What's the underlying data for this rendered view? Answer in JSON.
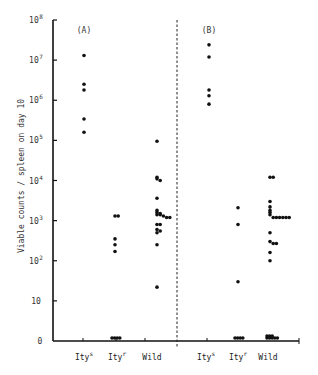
{
  "chart_data": {
    "type": "scatter",
    "title": "",
    "xlabel": "",
    "ylabel": "Viable counts / spleen on day 10",
    "yscale": "log",
    "ylim": [
      0,
      100000000
    ],
    "y_ticks": [
      {
        "value": 0,
        "base": "0",
        "exp": ""
      },
      {
        "value": 10,
        "base": "10",
        "exp": ""
      },
      {
        "value": 100,
        "base": "10",
        "exp": "2"
      },
      {
        "value": 1000,
        "base": "10",
        "exp": "3"
      },
      {
        "value": 10000,
        "base": "10",
        "exp": "4"
      },
      {
        "value": 100000,
        "base": "10",
        "exp": "5"
      },
      {
        "value": 1000000,
        "base": "10",
        "exp": "6"
      },
      {
        "value": 10000000,
        "base": "10",
        "exp": "7"
      },
      {
        "value": 100000000,
        "base": "10",
        "exp": "8"
      }
    ],
    "grid": false,
    "legend": "none",
    "panels": [
      {
        "label": "(A)",
        "categories": [
          {
            "name": "Ity",
            "sup": "s",
            "values": [
              13000000,
              2500000,
              1800000,
              340000,
              160000
            ]
          },
          {
            "name": "Ity",
            "sup": "r",
            "values": [
              1300,
              1300,
              350,
              250,
              170,
              0,
              0,
              0,
              0
            ]
          },
          {
            "name": "Wild",
            "sup": "",
            "values": [
              95000,
              12000,
              11000,
              10000,
              3600,
              1800,
              1600,
              1500,
              1400,
              1400,
              1300,
              1200,
              1200,
              800,
              800,
              600,
              550,
              500,
              250,
              22
            ]
          }
        ]
      },
      {
        "label": "(B)",
        "categories": [
          {
            "name": "Ity",
            "sup": "s",
            "values": [
              24000000,
              12000000,
              1800000,
              1300000,
              800000
            ]
          },
          {
            "name": "Ity",
            "sup": "r",
            "values": [
              2100,
              800,
              30,
              0,
              0,
              0,
              0
            ]
          },
          {
            "name": "Wild",
            "sup": "",
            "values": [
              12000,
              12000,
              3000,
              2200,
              1800,
              1600,
              1400,
              1200,
              1200,
              1200,
              1200,
              1200,
              1200,
              500,
              300,
              270,
              270,
              160,
              100,
              0,
              0,
              0,
              0,
              0,
              0,
              0,
              0
            ]
          }
        ]
      }
    ]
  }
}
